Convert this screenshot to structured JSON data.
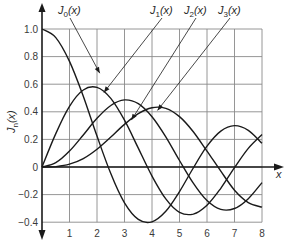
{
  "chart_data": {
    "type": "line",
    "title": "",
    "xlabel": "x",
    "ylabel": "J_n(x)",
    "xlim": [
      0,
      8
    ],
    "ylim": [
      -0.4,
      1.0
    ],
    "grid": true,
    "legend": "callout labels with arrows at top",
    "x_ticks": [
      "1",
      "2",
      "3",
      "4",
      "5",
      "6",
      "7",
      "8"
    ],
    "y_ticks": [
      "1.0",
      "0.8",
      "0.6",
      "0.4",
      "0.2",
      "0",
      "-0.2",
      "-0.4"
    ],
    "x": [
      0,
      0.5,
      1,
      1.5,
      2,
      2.5,
      3,
      3.5,
      4,
      4.5,
      5,
      5.5,
      6,
      6.5,
      7,
      7.5,
      8
    ],
    "series": [
      {
        "name": "J0(x)",
        "label_main": "J",
        "label_sub": "0",
        "values": [
          1.0,
          0.938,
          0.765,
          0.512,
          0.224,
          -0.048,
          -0.26,
          -0.38,
          -0.397,
          -0.321,
          -0.178,
          -0.007,
          0.151,
          0.26,
          0.3,
          0.266,
          0.172
        ]
      },
      {
        "name": "J1(x)",
        "label_main": "J",
        "label_sub": "1",
        "values": [
          0.0,
          0.242,
          0.44,
          0.558,
          0.577,
          0.497,
          0.339,
          0.137,
          -0.066,
          -0.231,
          -0.328,
          -0.341,
          -0.277,
          -0.154,
          -0.005,
          0.135,
          0.235
        ]
      },
      {
        "name": "J2(x)",
        "label_main": "J",
        "label_sub": "2",
        "values": [
          0.0,
          0.031,
          0.115,
          0.232,
          0.353,
          0.446,
          0.486,
          0.459,
          0.364,
          0.218,
          0.047,
          -0.117,
          -0.243,
          -0.307,
          -0.301,
          -0.23,
          -0.113
        ]
      },
      {
        "name": "J3(x)",
        "label_main": "J",
        "label_sub": "3",
        "values": [
          0.0,
          0.003,
          0.02,
          0.061,
          0.129,
          0.217,
          0.309,
          0.387,
          0.43,
          0.425,
          0.365,
          0.256,
          0.115,
          -0.03,
          -0.168,
          -0.258,
          -0.291
        ]
      }
    ],
    "label_positions": [
      {
        "series": 0,
        "text_x": 58,
        "text_y": 14,
        "arrow_to_x": 2.1,
        "arrow_to_y": 0.68
      },
      {
        "series": 1,
        "text_x": 150,
        "text_y": 14,
        "arrow_to_x": 2.25,
        "arrow_to_y": 0.54
      },
      {
        "series": 2,
        "text_x": 184,
        "text_y": 14,
        "arrow_to_x": 3.25,
        "arrow_to_y": 0.34
      },
      {
        "series": 3,
        "text_x": 218,
        "text_y": 14,
        "arrow_to_x": 4.2,
        "arrow_to_y": 0.41
      }
    ]
  },
  "axis": {
    "x_label": "x",
    "y_label_main": "J",
    "y_label_sub": "n",
    "y_label_tail": "(x)"
  }
}
